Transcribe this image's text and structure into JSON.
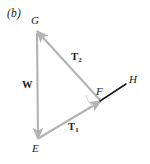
{
  "figure": {
    "panel_label": "(b)",
    "background_color": "#ffffff",
    "vector_color": "#b3b3b3",
    "line_color": "#1a1a1a",
    "text_color": "#1a1a1a",
    "width": 150,
    "height": 164,
    "vertices": [
      {
        "name": "G",
        "label": "G",
        "x": 37,
        "y": 31
      },
      {
        "name": "E",
        "label": "E",
        "x": 38,
        "y": 139
      },
      {
        "name": "F",
        "label": "F",
        "x": 101,
        "y": 101
      },
      {
        "name": "H",
        "label": "H",
        "x": 126,
        "y": 84
      }
    ],
    "vectors": [
      {
        "name": "W",
        "label": "W",
        "subscript": "",
        "from": "G",
        "to": "E",
        "color": "#b3b3b3",
        "label_x": 22,
        "label_y": 80
      },
      {
        "name": "T1",
        "label": "T",
        "subscript": "1",
        "from": "E",
        "to": "F",
        "color": "#b3b3b3",
        "label_x": 68,
        "label_y": 122
      },
      {
        "name": "T2",
        "label": "T",
        "subscript": "2",
        "from": "F",
        "to": "G",
        "color": "#b3b3b3",
        "label_x": 71,
        "label_y": 52
      }
    ],
    "segments": [
      {
        "name": "FH",
        "from": "F",
        "to": "H",
        "color": "#1a1a1a"
      }
    ],
    "vertex_label_positions": [
      {
        "name": "G",
        "label": "G",
        "x": 31,
        "y": 15
      },
      {
        "name": "E",
        "label": "E",
        "x": 32,
        "y": 143
      },
      {
        "name": "F",
        "label": "F",
        "x": 96,
        "y": 86
      },
      {
        "name": "H",
        "label": "H",
        "x": 129,
        "y": 74
      }
    ],
    "panel_label_pos": {
      "x": 7,
      "y": 8
    }
  }
}
